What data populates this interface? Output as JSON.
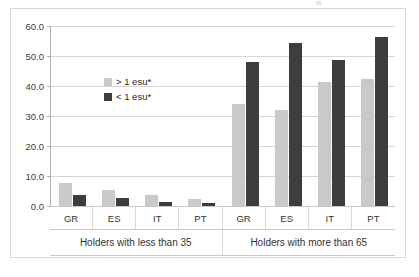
{
  "chart_data": {
    "type": "bar",
    "title": "",
    "subtitle": "",
    "xlabel": "",
    "ylabel": "",
    "ylim": [
      0.0,
      60.0
    ],
    "ytick_step": 10.0,
    "ytick_labels": [
      "0.0",
      "10.0",
      "20.0",
      "30.0",
      "40.0",
      "50.0",
      "60.0"
    ],
    "ytick_values": [
      0.0,
      10.0,
      20.0,
      30.0,
      40.0,
      50.0,
      60.0
    ],
    "grid": true,
    "legend_position": "inside-upper-left",
    "categories": [
      "GR",
      "ES",
      "IT",
      "PT",
      "GR",
      "ES",
      "IT",
      "PT"
    ],
    "groups": [
      {
        "label": "Holders with less than 35",
        "categories": [
          "GR",
          "ES",
          "IT",
          "PT"
        ]
      },
      {
        "label": "Holders with more than 65",
        "categories": [
          "GR",
          "ES",
          "IT",
          "PT"
        ]
      }
    ],
    "series": [
      {
        "name": "> 1 esu*",
        "color": "#c9c9c9",
        "values": [
          7.6,
          5.4,
          3.8,
          2.5,
          34.0,
          32.1,
          41.4,
          42.2
        ]
      },
      {
        "name": "< 1 esu*",
        "color": "#3d3d3d",
        "values": [
          3.6,
          2.8,
          1.5,
          1.1,
          48.0,
          54.2,
          48.8,
          56.4
        ]
      }
    ]
  },
  "legend": {
    "items": [
      {
        "label": "> 1 esu*",
        "color": "#c9c9c9"
      },
      {
        "label": "< 1 esu*",
        "color": "#3d3d3d"
      }
    ]
  },
  "axis": {
    "y_labels": [
      "60.0",
      "50.0",
      "40.0",
      "30.0",
      "20.0",
      "10.0",
      "0.0"
    ]
  },
  "colors": {
    "series_light": "#c9c9c9",
    "series_dark": "#3d3d3d",
    "gridline": "#d6d6d6",
    "frame": "#d9d9d9",
    "text": "#333333"
  }
}
